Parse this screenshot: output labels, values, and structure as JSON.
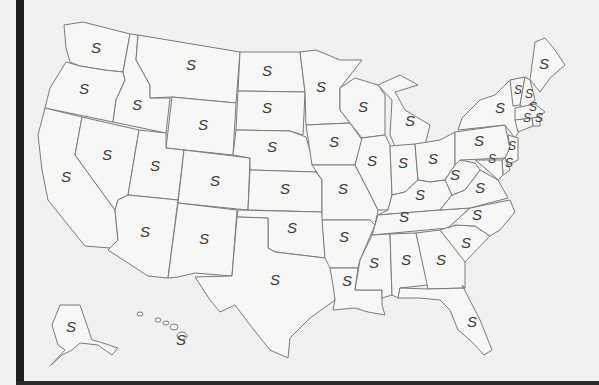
{
  "map": {
    "title": "",
    "label_glyph": "S",
    "colors": {
      "background": "#f1f1ef",
      "state_fill": "#f7f7f5",
      "border": "#7a7a7a",
      "label": "#3a3a3a",
      "frame": "#1e1e1e"
    },
    "states": [
      {
        "id": "WA",
        "label": "S"
      },
      {
        "id": "OR",
        "label": "S"
      },
      {
        "id": "CA",
        "label": "S"
      },
      {
        "id": "ID",
        "label": "S"
      },
      {
        "id": "NV",
        "label": "S"
      },
      {
        "id": "MT",
        "label": "S"
      },
      {
        "id": "WY",
        "label": "S"
      },
      {
        "id": "UT",
        "label": "S"
      },
      {
        "id": "AZ",
        "label": "S"
      },
      {
        "id": "CO",
        "label": "S"
      },
      {
        "id": "NM",
        "label": "S"
      },
      {
        "id": "ND",
        "label": "S"
      },
      {
        "id": "SD",
        "label": "S"
      },
      {
        "id": "NE",
        "label": "S"
      },
      {
        "id": "KS",
        "label": "S"
      },
      {
        "id": "OK",
        "label": "S"
      },
      {
        "id": "TX",
        "label": "S"
      },
      {
        "id": "MN",
        "label": "S"
      },
      {
        "id": "IA",
        "label": "S"
      },
      {
        "id": "MO",
        "label": "S"
      },
      {
        "id": "AR",
        "label": "S"
      },
      {
        "id": "LA",
        "label": "S"
      },
      {
        "id": "WI",
        "label": "S"
      },
      {
        "id": "IL",
        "label": "S"
      },
      {
        "id": "MI",
        "label": "S"
      },
      {
        "id": "IN",
        "label": "S"
      },
      {
        "id": "OH",
        "label": "S"
      },
      {
        "id": "KY",
        "label": "S"
      },
      {
        "id": "TN",
        "label": "S"
      },
      {
        "id": "MS",
        "label": "S"
      },
      {
        "id": "AL",
        "label": "S"
      },
      {
        "id": "GA",
        "label": "S"
      },
      {
        "id": "FL",
        "label": "S"
      },
      {
        "id": "SC",
        "label": "S"
      },
      {
        "id": "NC",
        "label": "S"
      },
      {
        "id": "VA",
        "label": "S"
      },
      {
        "id": "WV",
        "label": "S"
      },
      {
        "id": "PA",
        "label": "S"
      },
      {
        "id": "NY",
        "label": "S"
      },
      {
        "id": "ME",
        "label": "S"
      },
      {
        "id": "VT",
        "label": "S"
      },
      {
        "id": "NH",
        "label": "S"
      },
      {
        "id": "MA",
        "label": "S"
      },
      {
        "id": "RI",
        "label": "S"
      },
      {
        "id": "CT",
        "label": "S"
      },
      {
        "id": "NJ",
        "label": "S"
      },
      {
        "id": "DE",
        "label": "S"
      },
      {
        "id": "MD",
        "label": "S"
      },
      {
        "id": "AK",
        "label": "S"
      },
      {
        "id": "HI",
        "label": "S"
      }
    ]
  }
}
